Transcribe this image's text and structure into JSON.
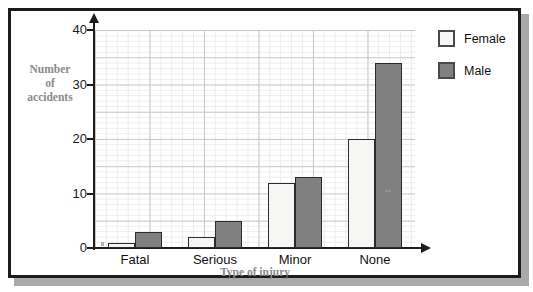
{
  "chart_data": {
    "type": "bar",
    "title": "",
    "xlabel": "Type of injury",
    "ylabel": "Number of accidents",
    "ylabel_lines": [
      "Number",
      "of",
      "accidents"
    ],
    "categories": [
      "Fatal",
      "Serious",
      "Minor",
      "None"
    ],
    "series": [
      {
        "name": "Female",
        "color": "#f6f6f4",
        "values": [
          1,
          2,
          12,
          20
        ]
      },
      {
        "name": "Male",
        "color": "#808080",
        "values": [
          3,
          5,
          13,
          34
        ]
      }
    ],
    "ylim": [
      0,
      40
    ],
    "yticks": [
      0,
      10,
      20,
      30,
      40
    ],
    "ytick_labels": [
      "0",
      "10",
      "20",
      "30",
      "40"
    ],
    "grid": true,
    "grid_major_step": 5,
    "grid_minor_step": 1,
    "legend_position": "right-top"
  },
  "legend": {
    "items": [
      {
        "label": "Female",
        "swatch": "female"
      },
      {
        "label": "Male",
        "swatch": "male"
      }
    ]
  },
  "colors": {
    "female_fill": "#f6f6f4",
    "male_fill": "#808080",
    "bar_outline": "#2b2b2b",
    "axis": "#1c1c1c",
    "grid_major": "#c9c9c9",
    "grid_minor": "#ececec",
    "label_grey": "#8a8a8a",
    "frame": "#1c1c1c"
  }
}
